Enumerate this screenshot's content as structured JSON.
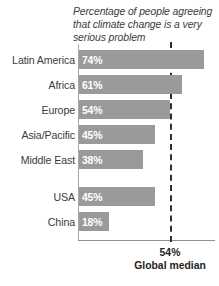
{
  "chart_data": {
    "type": "bar",
    "orientation": "horizontal",
    "title": "Percentage of people agreeing that climate change is a very serious problem",
    "xlabel": "",
    "ylabel": "",
    "xlim": [
      0,
      80
    ],
    "grid": false,
    "legend": null,
    "categories": [
      "Latin America",
      "Africa",
      "Europe",
      "Asia/Pacific",
      "Middle East",
      "USA",
      "China"
    ],
    "values": [
      74,
      61,
      54,
      45,
      38,
      45,
      18
    ],
    "value_labels": [
      "74%",
      "61%",
      "54%",
      "45%",
      "38%",
      "45%",
      "18%"
    ],
    "group_break_after": "Middle East",
    "annotations": [
      {
        "name": "global-median",
        "value": 54,
        "label_value": "54%",
        "label_text": "Global median",
        "style": "dashed-vertical-line"
      }
    ],
    "colors": {
      "bar": "#9a9a9a",
      "bar_label": "#ffffff",
      "category_label": "#3b3b3b",
      "title": "#3b3b3b",
      "axis": "#8f8f8f",
      "median_line": "#2f2f2f",
      "annotation_text": "#1e1e1e",
      "background": "#ffffff"
    }
  }
}
